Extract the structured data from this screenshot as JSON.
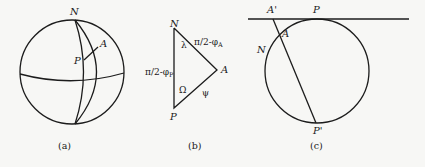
{
  "figure": {
    "panels": [
      {
        "id": "a",
        "caption": "(a)",
        "description": "Sphere with north pole N, equator, two meridians through N; point P and point A joined by arc",
        "labels": {
          "north": "N",
          "point_a": "A",
          "point_p": "P"
        }
      },
      {
        "id": "b",
        "caption": "(b)",
        "description": "Spherical triangle N-A-P",
        "labels": {
          "vertex_n": "N",
          "vertex_a": "A",
          "vertex_p": "P",
          "angle_n": "λ",
          "angle_p": "Ω",
          "side_na": "π/2-φ",
          "side_na_sub": "A",
          "side_np": "π/2-φ",
          "side_np_sub": "P",
          "side_pa": "ψ"
        }
      },
      {
        "id": "c",
        "caption": "(c)",
        "description": "Stereographic projection: circle tangent to line at P, chord from P' through A to A' on line",
        "labels": {
          "point_p": "P",
          "point_a_prime": "A'",
          "point_a": "A",
          "north": "N",
          "point_p_prime": "P'"
        }
      }
    ],
    "colors": {
      "ink": "#1c1c1c",
      "background": "#f7f7f5"
    }
  }
}
